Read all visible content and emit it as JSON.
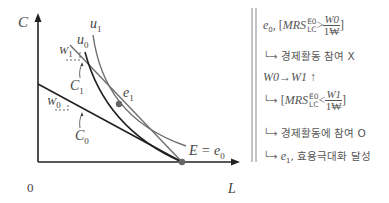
{
  "diagram": {
    "axes": {
      "y_label": "C",
      "x_label": "L",
      "origin_label": "0"
    },
    "curves": {
      "u0_label": "u",
      "u0_sub": "0",
      "u1_label": "u",
      "u1_sub": "1"
    },
    "budget_lines": {
      "w0_label": "W",
      "w0_sub": "0",
      "w1_label": "W",
      "w1_sub": "1",
      "c0_label": "C",
      "c0_sub": "0",
      "c1_label": "C",
      "c1_sub": "1"
    },
    "points": {
      "e1_label": "e",
      "e1_sub": "1",
      "endowment_label": "E = e",
      "endowment_sub": "0"
    },
    "colors": {
      "black_line": "#222222",
      "gray_line": "#6e6e6e",
      "point": "#666666"
    }
  },
  "notes": {
    "line1": {
      "prefix": "e",
      "prefix_sub": "0",
      "comma": ", [",
      "mrs": "MRS",
      "mrs_sup": "E0",
      "mrs_sub": "LC",
      "op": ">",
      "frac_num": "W0",
      "frac_den": "1₩",
      "close": "]"
    },
    "line2": {
      "arrow": "└→",
      "text": "경제활동 참여 X"
    },
    "line3": {
      "text": "W0→W1 ↑"
    },
    "line4": {
      "arrow": "└→",
      "open": "[",
      "mrs": "MRS",
      "mrs_sup": "E0",
      "mrs_sub": "LC",
      "op": "<",
      "frac_num": "W1",
      "frac_den": "1₩",
      "close": "]"
    },
    "line5": {
      "arrow": "└→",
      "text": "경제활동에 참여 O"
    },
    "line6": {
      "arrow": "└→",
      "prefix": "e",
      "prefix_sub": "1",
      "text": ", 효용극대화 달성"
    }
  }
}
